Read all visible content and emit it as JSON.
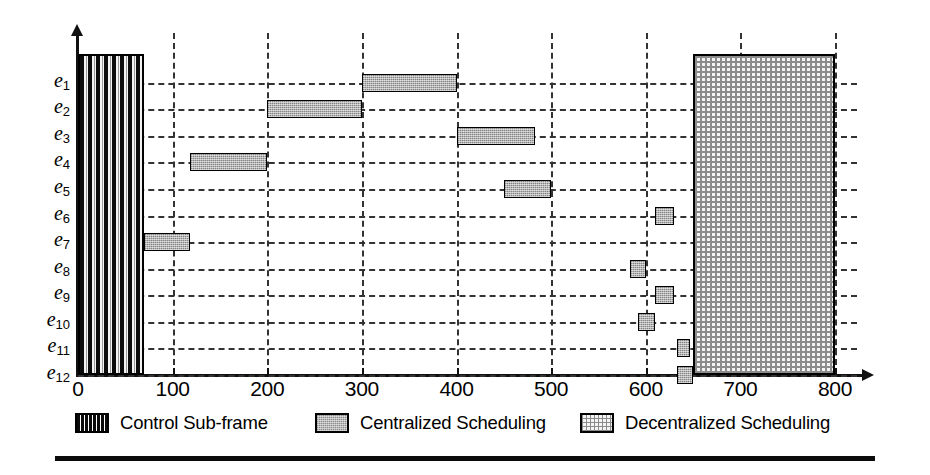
{
  "chart_data": {
    "type": "bar",
    "subtype": "gantt",
    "title": "",
    "xlabel": "",
    "ylabel": "",
    "xlim": [
      0,
      800
    ],
    "xticks": [
      0,
      100,
      200,
      300,
      400,
      500,
      600,
      700,
      800
    ],
    "xtick_labels": [
      "0",
      "100",
      "200",
      "300",
      "400",
      "500",
      "600",
      "700",
      "800"
    ],
    "grid": "dashed both axes",
    "legend_position": "below axes",
    "categories": [
      "e1",
      "e2",
      "e3",
      "e4",
      "e5",
      "e6",
      "e7",
      "e8",
      "e9",
      "e10",
      "e11",
      "e12"
    ],
    "category_labels": [
      {
        "base": "e",
        "sub": "1"
      },
      {
        "base": "e",
        "sub": "2"
      },
      {
        "base": "e",
        "sub": "3"
      },
      {
        "base": "e",
        "sub": "4"
      },
      {
        "base": "e",
        "sub": "5"
      },
      {
        "base": "e",
        "sub": "6"
      },
      {
        "base": "e",
        "sub": "7"
      },
      {
        "base": "e",
        "sub": "8"
      },
      {
        "base": "e",
        "sub": "9"
      },
      {
        "base": "e",
        "sub": "10"
      },
      {
        "base": "e",
        "sub": "11"
      },
      {
        "base": "e",
        "sub": "12"
      }
    ],
    "series": [
      {
        "name": "Control Sub-frame",
        "style": "black-vertical-stripes",
        "spans_all_rows": true,
        "bars": [
          {
            "start": 0,
            "end": 70,
            "row_start": "e1",
            "row_end": "e12"
          }
        ]
      },
      {
        "name": "Centralized Scheduling",
        "style": "grey-stipple",
        "bars": [
          {
            "row": "e1",
            "start": 300,
            "end": 400
          },
          {
            "row": "e2",
            "start": 200,
            "end": 300
          },
          {
            "row": "e3",
            "start": 400,
            "end": 483
          },
          {
            "row": "e4",
            "start": 118,
            "end": 200
          },
          {
            "row": "e5",
            "start": 450,
            "end": 500
          },
          {
            "row": "e6",
            "start": 610,
            "end": 630
          },
          {
            "row": "e7",
            "start": 70,
            "end": 118
          },
          {
            "row": "e8",
            "start": 583,
            "end": 600
          },
          {
            "row": "e9",
            "start": 610,
            "end": 630
          },
          {
            "row": "e10",
            "start": 592,
            "end": 610
          },
          {
            "row": "e11",
            "start": 633,
            "end": 647
          },
          {
            "row": "e12",
            "start": 633,
            "end": 650
          }
        ]
      },
      {
        "name": "Decentralized Scheduling",
        "style": "cross-hatch",
        "spans_all_rows": true,
        "bars": [
          {
            "start": 650,
            "end": 800,
            "row_start": "e1",
            "row_end": "e12"
          }
        ]
      }
    ]
  },
  "legend": {
    "items": [
      {
        "label": "Control Sub-frame",
        "swatch": "control-swatch"
      },
      {
        "label": "Centralized Scheduling",
        "swatch": "centralized-swatch"
      },
      {
        "label": "Decentralized Scheduling",
        "swatch": "decentralized-swatch"
      }
    ]
  },
  "colors": {
    "axis": "#111111",
    "grid": "#333333",
    "bar_fill": "#b4b4b4",
    "bar_border": "#000000",
    "control_fill": "#0a0a0a",
    "decentralized_fill": "#8c8c8c",
    "background": "#ffffff"
  }
}
